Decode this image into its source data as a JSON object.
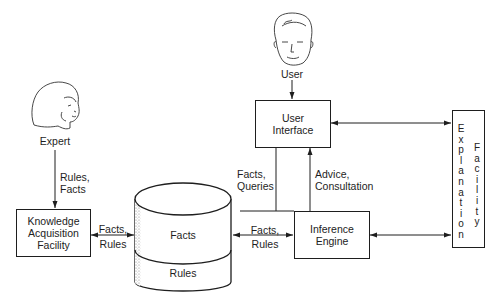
{
  "diagram": {
    "type": "expert-system-architecture",
    "actors": [
      {
        "id": "expert",
        "label": "Expert",
        "icon": "woman-face-icon"
      },
      {
        "id": "user",
        "label": "User",
        "icon": "man-face-icon"
      }
    ],
    "nodes": {
      "kaf": {
        "label": "Knowledge\nAcquisition\nFacility"
      },
      "ui": {
        "label": "User\nInterface"
      },
      "ie": {
        "label": "Inference\nEngine"
      },
      "kb": {
        "top_label": "Facts",
        "bottom_label": "Rules",
        "shape": "cylinder"
      },
      "ef": {
        "col1": "Explanation",
        "col2": "Facility"
      }
    },
    "edges": [
      {
        "from": "expert",
        "to": "kaf",
        "label": "Rules,\nFacts",
        "direction": "one-way"
      },
      {
        "from": "kaf",
        "to": "kb",
        "label_top": "Facts,",
        "label_bottom": "Rules",
        "direction": "two-way"
      },
      {
        "from": "user",
        "to": "ui",
        "label": "",
        "direction": "one-way"
      },
      {
        "from": "ui",
        "to": "kb",
        "label": "Facts,\nQueries",
        "direction": "line"
      },
      {
        "from": "ie",
        "to": "ui",
        "label": "Advice,\nConsultation",
        "direction": "one-way"
      },
      {
        "from": "kb",
        "to": "ie",
        "label_top": "Facts,",
        "label_bottom": "Rules",
        "direction": "two-way"
      },
      {
        "from": "ui",
        "to": "ef",
        "label": "",
        "direction": "two-way"
      },
      {
        "from": "ie",
        "to": "ef",
        "label": "",
        "direction": "two-way"
      }
    ]
  }
}
